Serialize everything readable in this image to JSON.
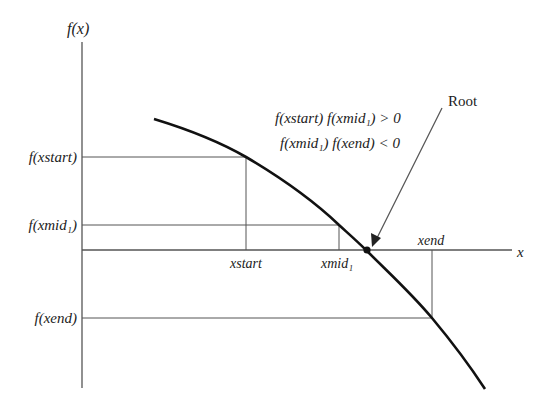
{
  "diagram": {
    "y_axis_label": "f(x)",
    "x_axis_label": "x",
    "y_labels": {
      "f_xstart": "f(xstart)",
      "f_xmid": "f(xmid₁)",
      "f_xend": "f(xend)"
    },
    "x_labels": {
      "xstart": "xstart",
      "xmid": "xmid₁",
      "xend": "xend"
    },
    "conditions": [
      "f(xstart) f(xmid₁) > 0",
      "f(xmid₁) f(xend) < 0"
    ],
    "root_label": "Root",
    "colors": {
      "curve": "#111111",
      "axes": "#555555",
      "guides": "#555555",
      "text": "#222222"
    }
  }
}
